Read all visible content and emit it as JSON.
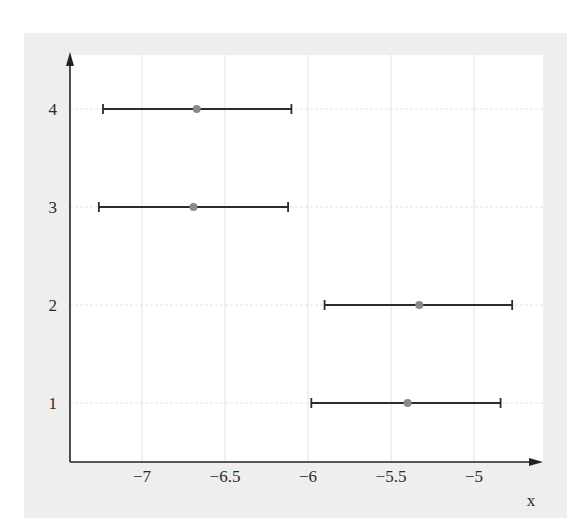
{
  "chart_data": {
    "type": "errorbar",
    "title": "",
    "xlabel": "x",
    "ylabel": "",
    "xlim": [
      -7.43,
      -4.6
    ],
    "ylim": [
      0.4,
      4.55
    ],
    "grid": true,
    "legend": null,
    "x_ticks": [
      -7,
      -6.5,
      -6,
      -5.5,
      -5
    ],
    "x_tick_labels": [
      "−7",
      "−6.5",
      "−6",
      "−5.5",
      "−5"
    ],
    "y_ticks": [
      1,
      2,
      3,
      4
    ],
    "y_tick_labels": [
      "1",
      "2",
      "3",
      "4"
    ],
    "points": [
      {
        "y": 1,
        "x": -5.4,
        "x_low": -5.98,
        "x_high": -4.84
      },
      {
        "y": 2,
        "x": -5.33,
        "x_low": -5.9,
        "x_high": -4.77
      },
      {
        "y": 3,
        "x": -6.69,
        "x_low": -7.26,
        "x_high": -6.12
      },
      {
        "y": 4,
        "x": -6.67,
        "x_low": -7.235,
        "x_high": -6.1
      }
    ]
  },
  "colors": {
    "panel_background": "#eeeeee",
    "plot_background": "#ffffff",
    "grid": "#e2e2e2",
    "axis": "#222222",
    "errorbar": "#2b2b2b",
    "marker": "#8a8a8a",
    "text": "#2a2a2a"
  }
}
